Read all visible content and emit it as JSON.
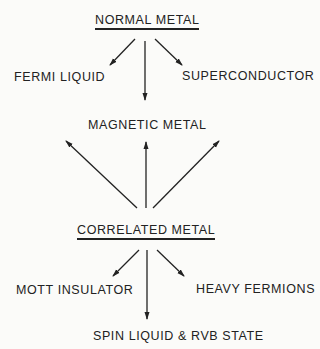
{
  "diagram": {
    "nodes": {
      "normal_metal": "NORMAL METAL",
      "fermi_liquid": "FERMI LIQUID",
      "superconductor": "SUPERCONDUCTOR",
      "magnetic_metal": "MAGNETIC METAL",
      "correlated_metal": "CORRELATED METAL",
      "mott_insulator": "MOTT INSULATOR",
      "heavy_fermions": "HEAVY FERMIONS",
      "spin_liquid": "SPIN LIQUID & RVB STATE"
    },
    "edges": [
      {
        "from": "NORMAL METAL",
        "to": "FERMI LIQUID"
      },
      {
        "from": "NORMAL METAL",
        "to": "MAGNETIC METAL"
      },
      {
        "from": "NORMAL METAL",
        "to": "SUPERCONDUCTOR"
      },
      {
        "from": "CORRELATED METAL",
        "to": "MAGNETIC METAL"
      },
      {
        "from": "CORRELATED METAL",
        "to": "MAGNETIC METAL"
      },
      {
        "from": "CORRELATED METAL",
        "to": "MAGNETIC METAL"
      },
      {
        "from": "CORRELATED METAL",
        "to": "MOTT INSULATOR"
      },
      {
        "from": "CORRELATED METAL",
        "to": "SPIN LIQUID & RVB STATE"
      },
      {
        "from": "CORRELATED METAL",
        "to": "HEAVY FERMIONS"
      }
    ],
    "ink_color": "#222222",
    "background": "#fbfbf9"
  }
}
